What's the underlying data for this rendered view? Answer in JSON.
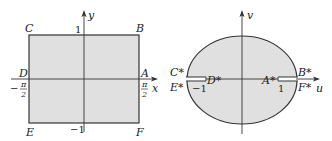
{
  "left_figure": {
    "axis_x_label": "x",
    "axis_y_label": "y",
    "corners": {
      "C": "C",
      "B": "B",
      "D": "D",
      "A": "A",
      "E": "E",
      "F": "F"
    },
    "tick_top": "1",
    "tick_bottom": "−1",
    "tick_left_sign": "−",
    "tick_left_num": "π",
    "tick_left_den": "2",
    "tick_right_num": "π",
    "tick_right_den": "2",
    "fill_color": "#e0e0e0",
    "stroke_color": "#333333"
  },
  "right_figure": {
    "axis_u_label": "u",
    "axis_v_label": "v",
    "points": {
      "C": "C*",
      "B": "B*",
      "D": "D*",
      "A": "A*",
      "E": "E*",
      "F": "F*"
    },
    "tick_left": "−1",
    "tick_right": "1",
    "fill_color": "#e0e0e0",
    "stroke_color": "#333333"
  }
}
